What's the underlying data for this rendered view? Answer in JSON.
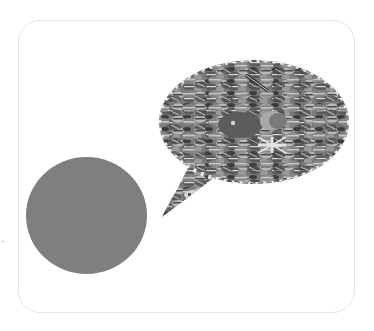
{
  "scene": {
    "description": "Grayscale illustration card: a solid gray circle at lower-left and a speech bubble made of a mosaic of round flag badges at upper-right.",
    "card": {
      "background": "#ffffff",
      "border_color": "#e6e6e6",
      "corner_radius_px": 22
    },
    "circle": {
      "label": "gray circle",
      "fill": "#7f7f7f"
    },
    "speech_bubble": {
      "label": "speech bubble of flag badges",
      "tone_dark": "#3c3c3c",
      "tone_mid": "#7a7a7a",
      "tone_light": "#b9b9b9",
      "tone_highlight": "#d9d9d9"
    }
  }
}
